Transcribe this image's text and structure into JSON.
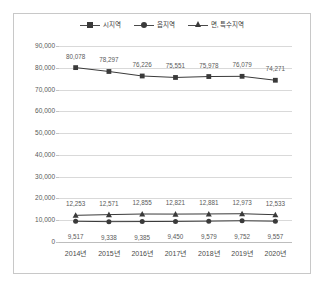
{
  "chart_data": {
    "type": "line",
    "title": "",
    "xlabel": "",
    "ylabel": "",
    "categories": [
      "2014년",
      "2015년",
      "2016년",
      "2017년",
      "2018년",
      "2019년",
      "2020년"
    ],
    "ylim": [
      0,
      90000
    ],
    "yticks": [
      "0",
      "10,000",
      "20,000",
      "30,000",
      "40,000",
      "50,000",
      "60,000",
      "70,000",
      "80,000",
      "90,000"
    ],
    "ytick_values": [
      0,
      10000,
      20000,
      30000,
      40000,
      50000,
      60000,
      70000,
      80000,
      90000
    ],
    "grid": true,
    "legend_position": "top-center",
    "series": [
      {
        "name": "시지역",
        "marker": "square",
        "color": "#3a3a3a",
        "values": [
          80078,
          78297,
          76226,
          75551,
          75978,
          76079,
          74271
        ],
        "labels": [
          "80,078",
          "78,297",
          "76,226",
          "75,551",
          "75,978",
          "76,079",
          "74,271"
        ]
      },
      {
        "name": "읍지역",
        "marker": "circle",
        "color": "#3a3a3a",
        "values": [
          9517,
          9338,
          9385,
          9450,
          9579,
          9752,
          9557
        ],
        "labels": [
          "9,517",
          "9,338",
          "9,385",
          "9,450",
          "9,579",
          "9,752",
          "9,557"
        ]
      },
      {
        "name": "면, 특수지역",
        "marker": "triangle",
        "color": "#3a3a3a",
        "values": [
          12253,
          12571,
          12855,
          12821,
          12881,
          12973,
          12533
        ],
        "labels": [
          "12,253",
          "12,571",
          "12,855",
          "12,821",
          "12,881",
          "12,973",
          "12,533"
        ]
      }
    ]
  }
}
